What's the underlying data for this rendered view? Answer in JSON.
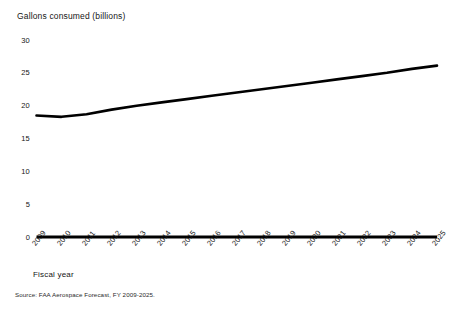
{
  "chart_data": {
    "type": "line",
    "title": "",
    "ylabel": "Gallons consumed (billions)",
    "xlabel": "Fiscal year",
    "source": "Source: FAA Aerospace Forecast, FY 2009-2025.",
    "ylim": [
      0,
      30
    ],
    "y_ticks": [
      "0",
      "5",
      "10",
      "15",
      "20",
      "25",
      "30"
    ],
    "y_tick_values": [
      0,
      5,
      10,
      15,
      20,
      25,
      30
    ],
    "grid": false,
    "legend": "none",
    "line_color": "#000000",
    "categories": [
      "2009",
      "2010",
      "2011",
      "2012",
      "2013",
      "2014",
      "2015",
      "2016",
      "2017",
      "2018",
      "2019",
      "2020",
      "2021",
      "2022",
      "2023",
      "2024",
      "2025"
    ],
    "x": [
      2009,
      2010,
      2011,
      2012,
      2013,
      2014,
      2015,
      2016,
      2017,
      2018,
      2019,
      2020,
      2021,
      2022,
      2023,
      2024,
      2025
    ],
    "values": [
      18.5,
      18.3,
      18.7,
      19.4,
      20.0,
      20.5,
      21.0,
      21.5,
      22.0,
      22.5,
      23.0,
      23.5,
      24.0,
      24.5,
      25.0,
      25.6,
      26.1
    ],
    "series": [
      {
        "name": "Gallons consumed",
        "values": [
          18.5,
          18.3,
          18.7,
          19.4,
          20.0,
          20.5,
          21.0,
          21.5,
          22.0,
          22.5,
          23.0,
          23.5,
          24.0,
          24.5,
          25.0,
          25.6,
          26.1
        ]
      }
    ]
  }
}
